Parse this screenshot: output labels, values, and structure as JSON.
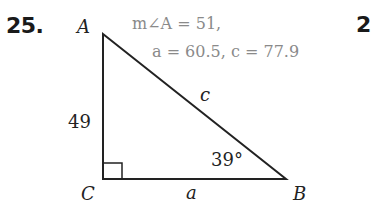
{
  "problem": {
    "number": "25.",
    "next_number_partial": "2",
    "given_line1": "m∠A = 51,",
    "given_line2": "a = 60.5,  c = 77.9"
  },
  "triangle": {
    "vertices": {
      "A": {
        "label": "A",
        "x": 103,
        "y": 34
      },
      "B": {
        "label": "B",
        "x": 286,
        "y": 179
      },
      "C": {
        "label": "C",
        "x": 103,
        "y": 179
      }
    },
    "right_angle_at": "C",
    "sides": {
      "AC": "49",
      "AB": "c",
      "CB": "a"
    },
    "angle_B": "39°"
  },
  "colors": {
    "ink": "#222222",
    "answer_gray": "#8a8a8a"
  }
}
